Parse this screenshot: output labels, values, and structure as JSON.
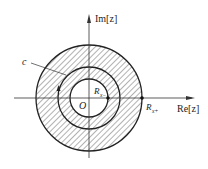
{
  "diagram": {
    "axes": {
      "x_label": "Re[z]",
      "y_label": "Im[z]"
    },
    "labels": {
      "origin": "O",
      "contour": "c",
      "inner_radius": "R",
      "inner_radius_sub": "x−",
      "outer_radius": "R",
      "outer_radius_sub": "x+"
    },
    "geometry": {
      "center": [
        89,
        98
      ],
      "outer_radius": 53,
      "contour_radius": 31,
      "inner_radius": 19
    },
    "colors": {
      "stroke": "#222222",
      "hatch": "#555555",
      "background": "#ffffff"
    }
  }
}
